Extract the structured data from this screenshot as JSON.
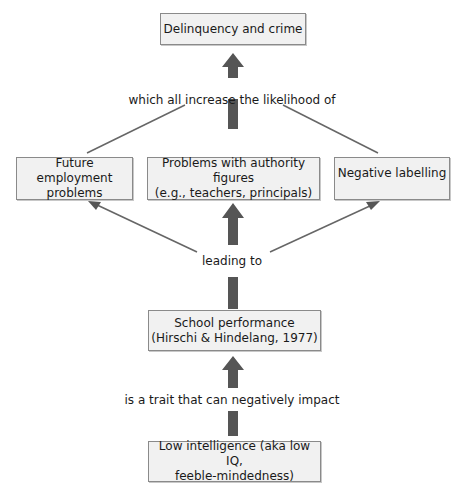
{
  "diagram": {
    "nodes": {
      "delinquency": {
        "line1": "Delinquency and crime"
      },
      "employment": {
        "line1": "Future employment",
        "line2": "problems"
      },
      "authority": {
        "line1": "Problems with authority figures",
        "line2": "(e.g., teachers, principals)"
      },
      "labelling": {
        "line1": "Negative labelling"
      },
      "school": {
        "line1": "School performance",
        "line2": "(Hirschi & Hindelang, 1977)"
      },
      "intelligence": {
        "line1": "Low intelligence (aka low IQ,",
        "line2": "feeble-mindedness)"
      }
    },
    "edge_labels": {
      "increase": "which all increase the likelihood of",
      "leading": "leading to",
      "trait": "is a trait that can negatively impact"
    },
    "colors": {
      "box_fill": "#f1f1f1",
      "box_border": "#8a8a8a",
      "arrow": "#555555"
    }
  }
}
